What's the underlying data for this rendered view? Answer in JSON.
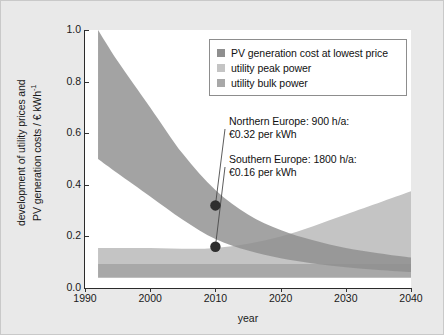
{
  "chart_data": {
    "type": "area",
    "title": "",
    "xlabel": "year",
    "ylabel_line1": "development of utility prices and",
    "ylabel_line2": "PV generation costs / € kWh",
    "ylabel_exponent": "-1",
    "xlim": [
      1990,
      2040
    ],
    "ylim": [
      0.0,
      1.0
    ],
    "xticks": [
      1990,
      2000,
      2010,
      2020,
      2030,
      2040
    ],
    "xtick_labels": [
      "1990",
      "2000",
      "2010",
      "2020",
      "2030",
      "2040"
    ],
    "yticks": [
      0.0,
      0.2,
      0.4,
      0.6,
      0.8,
      1.0
    ],
    "ytick_labels": [
      "0.0",
      "0.2",
      "0.4",
      "0.6",
      "0.8",
      "1.0"
    ],
    "grid": false,
    "legend_position": "upper right",
    "series": [
      {
        "name": "PV generation cost at lowest price",
        "color": "#8f8f8f",
        "type": "band",
        "x": [
          1992,
          1995,
          2000,
          2005,
          2010,
          2015,
          2020,
          2025,
          2030,
          2035,
          2040
        ],
        "upper": [
          1.0,
          0.88,
          0.7,
          0.52,
          0.38,
          0.285,
          0.225,
          0.185,
          0.155,
          0.135,
          0.118
        ],
        "lower": [
          0.5,
          0.445,
          0.355,
          0.265,
          0.19,
          0.145,
          0.115,
          0.095,
          0.08,
          0.07,
          0.062
        ]
      },
      {
        "name": "utility peak power",
        "color": "#c4c4c4",
        "type": "band",
        "x": [
          1992,
          2000,
          2010,
          2020,
          2030,
          2040
        ],
        "upper": [
          0.155,
          0.155,
          0.155,
          0.2,
          0.285,
          0.375
        ],
        "lower": [
          0.095,
          0.095,
          0.095,
          0.095,
          0.095,
          0.095
        ]
      },
      {
        "name": "utility bulk power",
        "color": "#a8a8a8",
        "type": "band",
        "x": [
          1992,
          2000,
          2010,
          2020,
          2030,
          2040
        ],
        "upper": [
          0.095,
          0.095,
          0.095,
          0.095,
          0.095,
          0.095
        ],
        "lower": [
          0.04,
          0.04,
          0.04,
          0.04,
          0.04,
          0.04
        ]
      }
    ],
    "annotations": [
      {
        "name": "northern-europe",
        "line1": "Northern Europe: 900 h/a:",
        "line2": "€0.32 per kWh",
        "point_x": 2010,
        "point_y": 0.32
      },
      {
        "name": "southern-europe",
        "line1": "Southern Europe: 1800 h/a:",
        "line2": "€0.16 per kWh",
        "point_x": 2010,
        "point_y": 0.16
      }
    ],
    "markers": [
      {
        "x": 2010,
        "y": 0.32,
        "color": "#2e2e2e"
      },
      {
        "x": 2010,
        "y": 0.16,
        "color": "#2e2e2e"
      }
    ]
  },
  "legend": {
    "items": [
      {
        "label": "PV generation cost at lowest price",
        "color": "#8f8f8f"
      },
      {
        "label": "utility peak power",
        "color": "#c4c4c4"
      },
      {
        "label": "utility bulk power",
        "color": "#a8a8a8"
      }
    ]
  },
  "colors": {
    "figure_background": "#e9e9e9",
    "plot_background": "#ffffff",
    "axis": "#2b2b2b",
    "text": "#111111",
    "pv_band": "#8f8f8f",
    "peak_band": "#c4c4c4",
    "bulk_band": "#a8a8a8",
    "marker": "#2e2e2e"
  }
}
